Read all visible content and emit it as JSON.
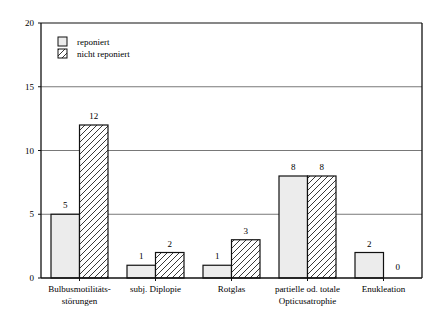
{
  "chart_data": {
    "type": "bar",
    "title": "",
    "xlabel": "",
    "ylabel": "",
    "ylim": [
      0,
      20
    ],
    "yticks": [
      0,
      5,
      10,
      15,
      20
    ],
    "grid": true,
    "legend_position": "top-left inside",
    "categories": [
      [
        "Bulbusmotilitäts-",
        "störungen"
      ],
      [
        "subj. Diplopie"
      ],
      [
        "Rotglas"
      ],
      [
        "partielle od. totale",
        "Opticusatrophie"
      ],
      [
        "Enukleation"
      ]
    ],
    "series": [
      {
        "name": "reponiert",
        "pattern": "solid-light-grey",
        "values": [
          5,
          1,
          1,
          8,
          2
        ]
      },
      {
        "name": "nicht reponiert",
        "pattern": "diagonal-hatch",
        "values": [
          12,
          2,
          3,
          8,
          0
        ]
      }
    ]
  },
  "colors": {
    "axis": "#111111",
    "grid": "#555555",
    "bar_fill_light": "#ececec",
    "hatch": "#222222"
  }
}
